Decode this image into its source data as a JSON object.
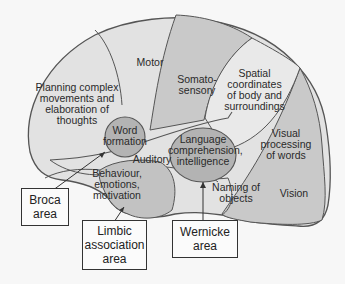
{
  "diagram": {
    "type": "brain-lateral-functional-areas",
    "colors": {
      "light_region": "#e2e2e2",
      "mid_region": "#c9c9c9",
      "dark_region": "#b3b3b3",
      "outline": "#555555",
      "background": "#f7f7f7"
    },
    "regions": {
      "planning": "Planning complex\nmovements and\nelaboration of\nthoughts",
      "motor": "Motor",
      "somatosensory": "Somato-\nsensory",
      "spatial": "Spatial\ncoordinates\nof body and\nsurroundings",
      "word_formation": "Word\nformation",
      "language": "Language\ncomprehension,\nintelligence",
      "visual_words": "Visual\nprocessing\nof words",
      "auditory": "Auditory",
      "behaviour": "Behaviour,\nemotions,\nmotivation",
      "naming": "Naming of\nobjects",
      "vision": "Vision"
    },
    "callouts": {
      "broca": "Broca\narea",
      "limbic": "Limbic\nassociation\narea",
      "wernicke": "Wernicke\narea"
    }
  }
}
